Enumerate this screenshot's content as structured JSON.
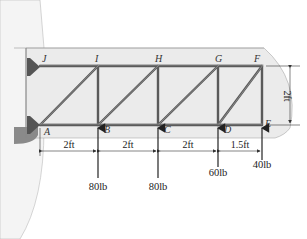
{
  "diagram": {
    "colors": {
      "background": "#ffffff",
      "panel": "#ececec",
      "wall": "#f2f2f2",
      "member": "#555555",
      "member_highlight": "#8a8a8a",
      "support": "#555555",
      "dimension": "#333333",
      "ground": "#7a7a7a"
    },
    "nodes": {
      "top": [
        {
          "id": "J",
          "label": "J"
        },
        {
          "id": "I",
          "label": "I"
        },
        {
          "id": "H",
          "label": "H"
        },
        {
          "id": "G",
          "label": "G"
        },
        {
          "id": "F",
          "label": "F"
        }
      ],
      "bottom": [
        {
          "id": "A",
          "label": "A"
        },
        {
          "id": "B",
          "label": "B"
        },
        {
          "id": "C",
          "label": "C"
        },
        {
          "id": "D",
          "label": "D"
        },
        {
          "id": "E",
          "label": "E"
        }
      ]
    },
    "dimensions": {
      "spans": [
        "2ft",
        "2ft",
        "2ft",
        "1.5ft"
      ],
      "height": "2ft"
    },
    "loads": [
      {
        "node": "B",
        "label": "80lb",
        "direction": "up"
      },
      {
        "node": "C",
        "label": "80lb",
        "direction": "up"
      },
      {
        "node": "D",
        "label": "60lb",
        "direction": "up"
      },
      {
        "node": "E",
        "label": "40lb",
        "direction": "up"
      }
    ]
  }
}
